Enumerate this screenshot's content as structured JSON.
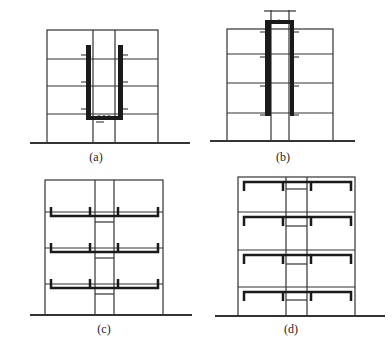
{
  "panels": [
    {
      "id": "a",
      "label": "(a)"
    },
    {
      "id": "b",
      "label": "(b)"
    },
    {
      "id": "c",
      "label": "(c)"
    },
    {
      "id": "d",
      "label": "(d)"
    }
  ],
  "colors": {
    "line": "#333333",
    "heavy": "#1a1a1a",
    "background": "#ffffff"
  }
}
